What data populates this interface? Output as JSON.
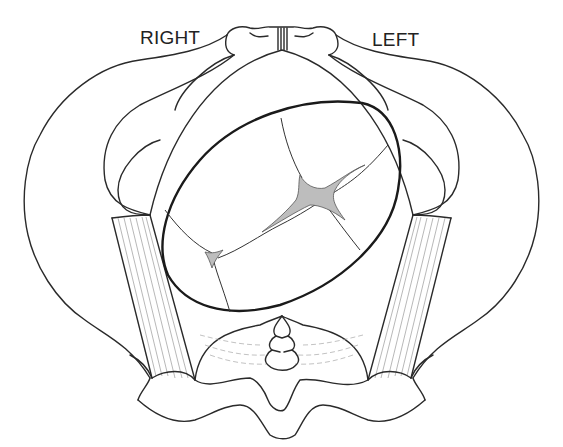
{
  "figure": {
    "labels": {
      "right": "RIGHT",
      "left": "LEFT"
    },
    "colors": {
      "line": "#2a2a2a",
      "fontanelle_fill": "#bdbdbd",
      "background": "#ffffff"
    }
  }
}
